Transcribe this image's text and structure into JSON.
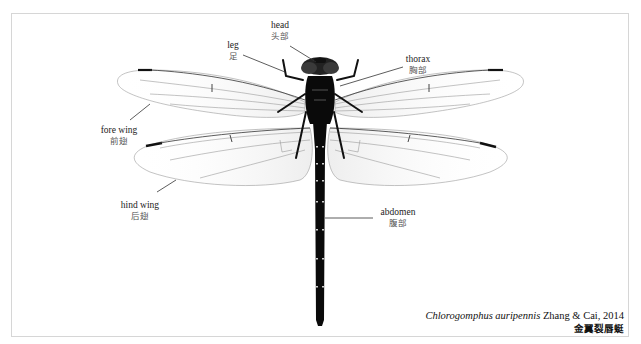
{
  "figure": {
    "labels": {
      "head": {
        "en": "head",
        "zh": "头部"
      },
      "leg": {
        "en": "leg",
        "zh": "足"
      },
      "thorax": {
        "en": "thorax",
        "zh": "胸部"
      },
      "fore_wing": {
        "en": "fore wing",
        "zh": "前翅"
      },
      "hind_wing": {
        "en": "hind wing",
        "zh": "后翅"
      },
      "abdomen": {
        "en": "abdomen",
        "zh": "腹部"
      }
    },
    "caption": {
      "species_italic": "Chlorogomphus auripennis",
      "authority": " Zhang & Cai, 2014",
      "zh_name": "金翼裂唇蜓"
    },
    "colors": {
      "body": "#0a0a0a",
      "wing_vein": "#9a9a9a",
      "pterostigma": "#111111",
      "frame_border": "#d6d6d6"
    }
  }
}
